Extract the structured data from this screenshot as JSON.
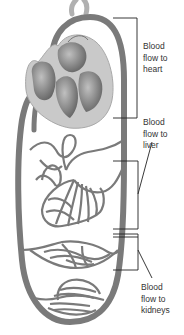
{
  "diagram": {
    "type": "circulatory-system",
    "colors": {
      "vessel": "#7a7a7a",
      "heart_outer": "#c8c8c8",
      "heart_chamber": "#8a8a8a",
      "bracket": "#222222",
      "text": "#333333"
    },
    "labels": [
      {
        "id": "heart",
        "lines": [
          "Blood",
          "flow to",
          "heart"
        ]
      },
      {
        "id": "liver",
        "lines": [
          "Blood",
          "flow to",
          "liver"
        ]
      },
      {
        "id": "kidneys",
        "lines": [
          "Blood",
          "flow to",
          "kidneys"
        ]
      }
    ]
  }
}
